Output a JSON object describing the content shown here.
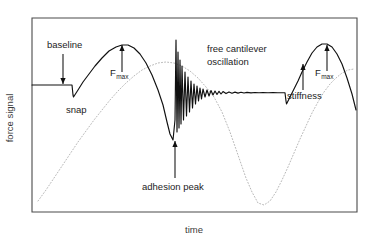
{
  "figure": {
    "title": "",
    "background_color": "#ffffff"
  },
  "axes": {
    "x_label": "time",
    "y_label": "force signal",
    "frame_color": "#4a4a4a",
    "x_ticks": [],
    "y_ticks": []
  },
  "annotations": [
    {
      "id": "baseline",
      "label": "baseline",
      "sub": "",
      "text_x": 47,
      "text_y": 48,
      "arrow": {
        "x1": 63,
        "y1": 54,
        "x2": 63,
        "y2": 84,
        "direction": "down"
      }
    },
    {
      "id": "snap",
      "label": "snap",
      "sub": "",
      "text_x": 66,
      "text_y": 113,
      "arrow": null
    },
    {
      "id": "fmax-approach",
      "label": "F",
      "sub": "max",
      "text_x": 110,
      "text_y": 76,
      "arrow": {
        "x1": 122,
        "y1": 72,
        "x2": 122,
        "y2": 45,
        "direction": "up"
      }
    },
    {
      "id": "free-cantilever-oscillation",
      "label": "free cantilever",
      "sub": "",
      "text_x": 207,
      "text_y": 52,
      "arrow": null
    },
    {
      "id": "free-cantilever-oscillation-line2",
      "label": "oscillation",
      "sub": "",
      "text_x": 207,
      "text_y": 65,
      "arrow": null
    },
    {
      "id": "adhesion-peak",
      "label": "adhesion peak",
      "sub": "",
      "text_x": 142,
      "text_y": 190,
      "arrow": {
        "x1": 175,
        "y1": 178,
        "x2": 175,
        "y2": 141,
        "direction": "up"
      }
    },
    {
      "id": "stiffness",
      "label": "stiffness",
      "sub": "",
      "text_x": 287,
      "text_y": 99,
      "arrow": {
        "x1": 303,
        "y1": 90,
        "x2": 303,
        "y2": 64,
        "direction": "up"
      }
    },
    {
      "id": "fmax-retract",
      "label": "F",
      "sub": "max",
      "text_x": 315,
      "text_y": 76,
      "arrow": {
        "x1": 327,
        "y1": 71,
        "x2": 327,
        "y2": 45,
        "direction": "up"
      }
    }
  ],
  "chart_data": {
    "type": "line",
    "title": "",
    "xlabel": "time",
    "ylabel": "force signal",
    "xlim": [
      0,
      1
    ],
    "ylim": [
      0,
      1
    ],
    "grid": false,
    "legend": null,
    "plot_frame": {
      "left": 32,
      "top": 18,
      "right": 357,
      "bottom": 212
    },
    "series": [
      {
        "name": "force signal",
        "style": "solid",
        "color": "#101010",
        "points": [
          [
            32,
            85
          ],
          [
            50,
            85
          ],
          [
            62,
            85
          ],
          [
            72,
            85
          ],
          [
            72.5,
            90
          ],
          [
            73,
            95
          ],
          [
            73.5,
            97
          ],
          [
            78,
            90
          ],
          [
            83,
            82
          ],
          [
            89,
            74
          ],
          [
            95,
            66
          ],
          [
            102,
            58
          ],
          [
            109,
            51
          ],
          [
            116,
            47
          ],
          [
            122,
            45
          ],
          [
            128,
            45
          ],
          [
            134,
            48
          ],
          [
            140,
            54
          ],
          [
            146,
            63
          ],
          [
            152,
            75
          ],
          [
            158,
            90
          ],
          [
            163,
            105
          ],
          [
            167,
            122
          ],
          [
            170,
            134
          ],
          [
            173,
            140
          ],
          [
            175,
            120
          ],
          [
            176,
            40
          ],
          [
            177,
            132
          ],
          [
            178,
            52
          ],
          [
            179,
            128
          ],
          [
            180,
            60
          ],
          [
            181,
            124
          ],
          [
            182,
            66
          ],
          [
            183.5,
            120
          ],
          [
            185,
            72
          ],
          [
            186.5,
            116
          ],
          [
            188,
            77
          ],
          [
            189.5,
            112
          ],
          [
            191,
            81
          ],
          [
            192.5,
            108
          ],
          [
            194,
            84
          ],
          [
            195.5,
            104
          ],
          [
            197,
            86
          ],
          [
            198.5,
            101
          ],
          [
            200,
            88
          ],
          [
            201.5,
            99
          ],
          [
            203,
            89
          ],
          [
            205,
            97
          ],
          [
            207,
            90
          ],
          [
            209,
            96
          ],
          [
            211,
            90.5
          ],
          [
            213,
            95
          ],
          [
            215,
            91
          ],
          [
            217,
            94.5
          ],
          [
            219,
            91.3
          ],
          [
            221,
            94
          ],
          [
            223,
            91.6
          ],
          [
            226,
            93.6
          ],
          [
            229,
            91.9
          ],
          [
            232,
            93.3
          ],
          [
            235,
            92.1
          ],
          [
            238,
            93.1
          ],
          [
            241,
            92.3
          ],
          [
            244,
            93
          ],
          [
            247,
            92.4
          ],
          [
            251,
            92.9
          ],
          [
            255,
            92.5
          ],
          [
            259,
            92.8
          ],
          [
            263,
            92.6
          ],
          [
            268,
            92.7
          ],
          [
            273,
            92.65
          ],
          [
            278,
            92.7
          ],
          [
            283,
            92.7
          ],
          [
            285,
            92.7
          ],
          [
            285.5,
            97
          ],
          [
            286,
            101
          ],
          [
            286.5,
            104
          ],
          [
            290,
            97
          ],
          [
            294,
            89
          ],
          [
            298,
            81
          ],
          [
            302,
            72
          ],
          [
            307,
            62
          ],
          [
            312,
            53
          ],
          [
            317,
            47
          ],
          [
            322,
            44
          ],
          [
            327,
            44
          ],
          [
            332,
            47
          ],
          [
            337,
            54
          ],
          [
            342,
            64
          ],
          [
            347,
            78
          ],
          [
            352,
            94
          ],
          [
            356,
            110
          ]
        ]
      },
      {
        "name": "piezo displacement (reference)",
        "style": "dotted",
        "color": "#b8b8b8",
        "points": [
          [
            38,
            201
          ],
          [
            46,
            190
          ],
          [
            54,
            178
          ],
          [
            62,
            166
          ],
          [
            70,
            154
          ],
          [
            78,
            142
          ],
          [
            86,
            131
          ],
          [
            94,
            120
          ],
          [
            102,
            110
          ],
          [
            110,
            100
          ],
          [
            118,
            91
          ],
          [
            126,
            83
          ],
          [
            134,
            76
          ],
          [
            142,
            70
          ],
          [
            150,
            66
          ],
          [
            158,
            63
          ],
          [
            166,
            62
          ],
          [
            174,
            63
          ],
          [
            182,
            66
          ],
          [
            190,
            71
          ],
          [
            198,
            78
          ],
          [
            206,
            87
          ],
          [
            214,
            97
          ],
          [
            222,
            112
          ],
          [
            230,
            132
          ],
          [
            238,
            155
          ],
          [
            246,
            178
          ],
          [
            252,
            192
          ],
          [
            258,
            203
          ],
          [
            264,
            205
          ],
          [
            270,
            201
          ],
          [
            276,
            192
          ],
          [
            282,
            180
          ],
          [
            288,
            167
          ],
          [
            294,
            153
          ],
          [
            300,
            139
          ],
          [
            306,
            126
          ],
          [
            312,
            113
          ],
          [
            318,
            102
          ],
          [
            324,
            92
          ],
          [
            330,
            84
          ],
          [
            336,
            78
          ],
          [
            342,
            73
          ],
          [
            348,
            70
          ],
          [
            354,
            69
          ]
        ]
      }
    ]
  }
}
